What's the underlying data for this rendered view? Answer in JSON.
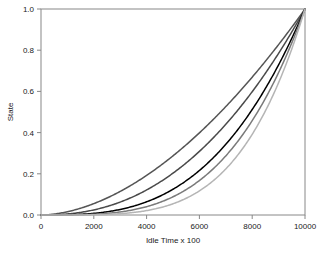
{
  "chart_data": {
    "type": "line",
    "title": "",
    "xlabel": "Idle Time x 100",
    "ylabel": "State",
    "xlim": [
      0,
      10000
    ],
    "ylim": [
      0.0,
      1.0
    ],
    "grid": false,
    "legend": "none",
    "xticks": [
      0,
      2000,
      4000,
      6000,
      8000,
      10000
    ],
    "xticklabels": [
      "0",
      "2000",
      "4000",
      "6000",
      "8000",
      "10000"
    ],
    "yticks": [
      0.0,
      0.2,
      0.4,
      0.6,
      0.8,
      1.0
    ],
    "yticklabels": [
      "0.0",
      "0.2",
      "0.4",
      "0.6",
      "0.8",
      "1.0"
    ],
    "x": [
      0,
      500,
      1000,
      1500,
      2000,
      2500,
      3000,
      3500,
      4000,
      4500,
      5000,
      5500,
      6000,
      6500,
      7000,
      7500,
      8000,
      8500,
      9000,
      9500,
      10000
    ],
    "series": [
      {
        "name": "curve-1",
        "color": "#555555",
        "exponent": 1.8,
        "values": [
          0.0,
          0.006,
          0.021,
          0.044,
          0.074,
          0.11,
          0.152,
          0.2,
          0.253,
          0.312,
          0.376,
          0.445,
          0.518,
          0.597,
          0.68,
          0.768,
          0.86,
          0.957,
          1.0,
          1.0,
          1.0
        ]
      },
      {
        "name": "curve-2",
        "color": "#4a4a4a",
        "exponent": 2.3,
        "values": [
          0.0,
          0.002,
          0.008,
          0.019,
          0.036,
          0.06,
          0.091,
          0.129,
          0.175,
          0.229,
          0.292,
          0.363,
          0.443,
          0.532,
          0.631,
          0.739,
          0.857,
          0.985,
          1.0,
          1.0,
          1.0
        ]
      },
      {
        "name": "curve-3",
        "color": "#000000",
        "exponent": 3.0,
        "values": [
          0.0,
          0.0,
          0.001,
          0.003,
          0.008,
          0.016,
          0.027,
          0.043,
          0.064,
          0.091,
          0.125,
          0.166,
          0.216,
          0.275,
          0.343,
          0.422,
          0.512,
          0.614,
          0.729,
          0.857,
          1.0
        ]
      },
      {
        "name": "curve-4",
        "color": "#7a7a7a",
        "exponent": 3.5,
        "values": [
          0.0,
          0.0,
          0.0,
          0.001,
          0.004,
          0.008,
          0.015,
          0.026,
          0.04,
          0.061,
          0.088,
          0.123,
          0.167,
          0.221,
          0.287,
          0.365,
          0.458,
          0.565,
          0.689,
          0.831,
          1.0
        ]
      },
      {
        "name": "curve-5",
        "color": "#b5b5b5",
        "exponent": 4.2,
        "values": [
          0.0,
          0.0,
          0.0,
          0.0,
          0.001,
          0.003,
          0.007,
          0.013,
          0.023,
          0.037,
          0.057,
          0.084,
          0.12,
          0.166,
          0.225,
          0.297,
          0.386,
          0.493,
          0.621,
          0.772,
          1.0
        ]
      }
    ],
    "axis_color": "#888888",
    "text_color": "#1a1a1a",
    "background": "#ffffff"
  }
}
